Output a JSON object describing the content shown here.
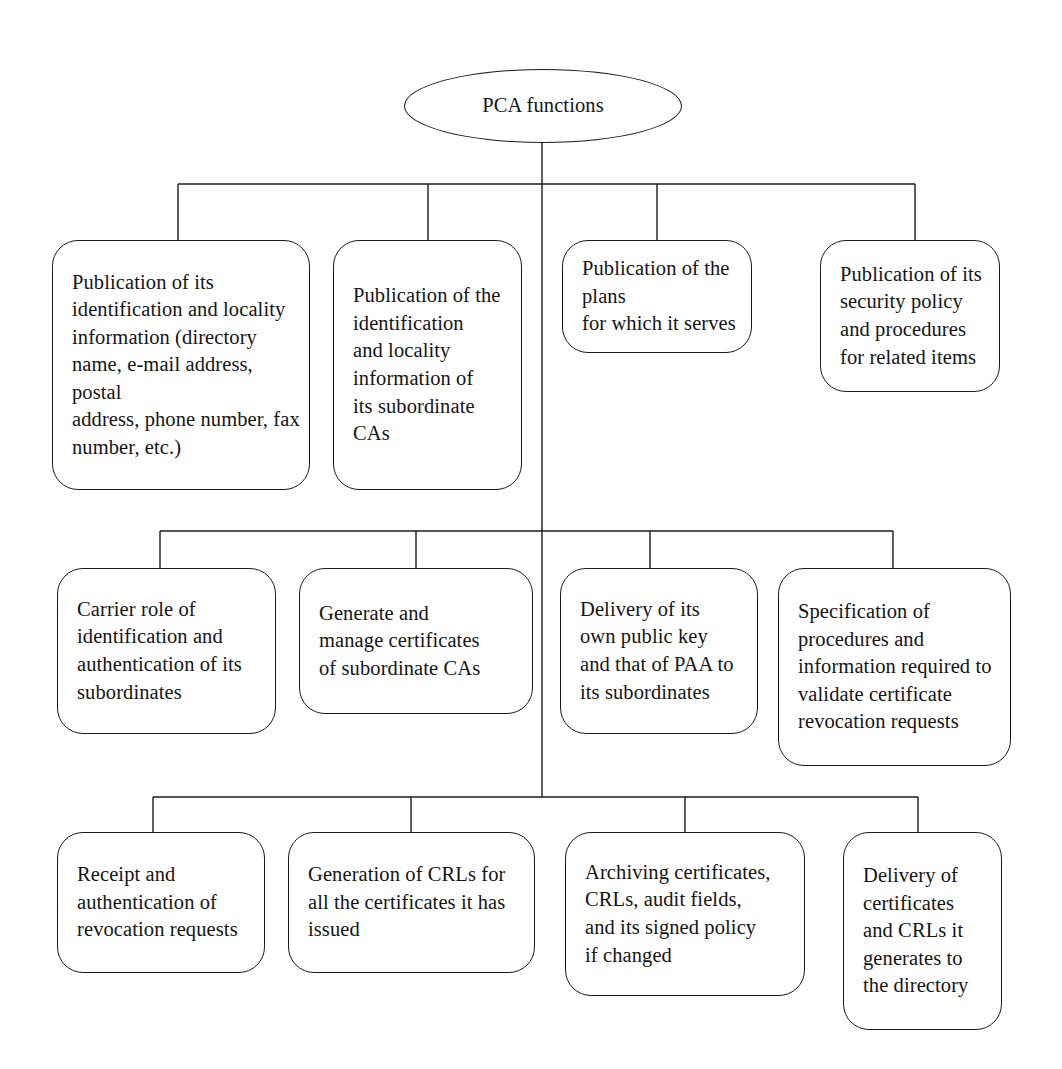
{
  "diagram": {
    "title_node": {
      "label": "PCA functions",
      "shape": "ellipse"
    },
    "rows": [
      {
        "row_name": "row-1-publication-functions",
        "nodes": [
          {
            "id": "pca-fn-1",
            "label": "Publication of its\nidentification and locality\ninformation (directory\nname, e-mail address, postal\naddress, phone number, fax\nnumber, etc.)"
          },
          {
            "id": "pca-fn-2",
            "label": "Publication of the\nidentification\nand locality\ninformation of\nits subordinate\nCAs"
          },
          {
            "id": "pca-fn-3",
            "label": "Publication of the plans\nfor which it serves"
          },
          {
            "id": "pca-fn-4",
            "label": "Publication of its\nsecurity policy\nand procedures\nfor related items"
          }
        ]
      },
      {
        "row_name": "row-2-identification-and-delivery-functions",
        "nodes": [
          {
            "id": "pca-fn-5",
            "label": "Carrier role of\nidentification and\nauthentication of its\nsubordinates"
          },
          {
            "id": "pca-fn-6",
            "label": "Generate and\nmanage certificates\nof subordinate CAs"
          },
          {
            "id": "pca-fn-7",
            "label": "Delivery of its\nown public key\nand that of PAA to\nits subordinates"
          },
          {
            "id": "pca-fn-8",
            "label": "Specification of\nprocedures and\ninformation required to\nvalidate certificate\nrevocation requests"
          }
        ]
      },
      {
        "row_name": "row-3-revocation-and-archiving-functions",
        "nodes": [
          {
            "id": "pca-fn-9",
            "label": "Receipt and\nauthentication of\nrevocation requests"
          },
          {
            "id": "pca-fn-10",
            "label": "Generation of CRLs for\nall the certificates it has\nissued"
          },
          {
            "id": "pca-fn-11",
            "label": "Archiving certificates,\nCRLs, audit fields,\nand its signed policy\nif changed"
          },
          {
            "id": "pca-fn-12",
            "label": "Delivery of\ncertificates\nand CRLs it\ngenerates to\nthe directory"
          }
        ]
      }
    ],
    "colors": {
      "stroke": "#1b1b1b",
      "text": "#141414",
      "background": "#ffffff"
    }
  }
}
